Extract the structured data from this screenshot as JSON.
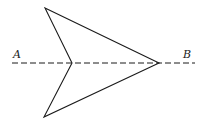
{
  "diagram": {
    "type": "geometry",
    "labels": {
      "a": "A",
      "b": "B"
    },
    "colors": {
      "stroke": "#1a1a1a",
      "background": "#ffffff"
    },
    "shape": {
      "vertices": {
        "top": [
          45,
          8
        ],
        "inner": [
          72,
          63
        ],
        "bottom": [
          44,
          117
        ],
        "tip": [
          159,
          63
        ]
      }
    },
    "axis": {
      "style": "dashed",
      "from": [
        12,
        63
      ],
      "to": [
        195,
        63
      ]
    }
  }
}
